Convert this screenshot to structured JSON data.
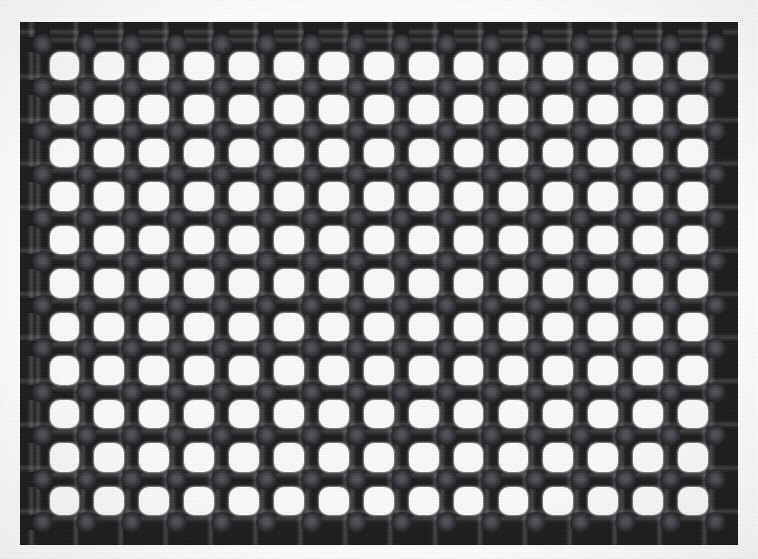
{
  "scene": {
    "title": "Perforated mesh macro photograph",
    "subject": "black plastic square-hole mesh screen",
    "alt_text": "Close-up of a black perforated grid with a regular array of rounded square holes and raised nubs at every bar intersection, photographed against a bright white backlit background.",
    "capture_note": "backlit flat-lay macro"
  },
  "canvas": {
    "width": 758,
    "height": 559,
    "background_color": "#ffffff"
  },
  "mesh": {
    "columns": 16,
    "rows": 12,
    "origin_x": 42,
    "origin_y": 44,
    "pitch_x": 44.9,
    "pitch_y": 43.5,
    "bar_thickness": 15,
    "hole_size": 30,
    "hole_corner_radius": 10,
    "node_diameter": 21,
    "stub_length": 22,
    "stub_width": 15
  },
  "colors": {
    "bar_dark": "#1c1c1c",
    "bar_edge": "#0e0e0e",
    "bar_sheen": "#55545a",
    "node_center": "#514f55",
    "node_rim": "#141414",
    "hole_fill": "#fbfbfa",
    "page_background": "#ffffff",
    "vignette": "#000000"
  },
  "measurements": {
    "left_margin": "25 px",
    "top_margin": "25 px",
    "right_margin": "25 px",
    "bottom_margin": "14 px",
    "hole_count": "165 full holes",
    "node_count": "192 intersections"
  }
}
